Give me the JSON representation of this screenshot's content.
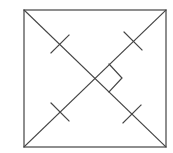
{
  "diagram": {
    "title": "",
    "stroke_color": "#444444",
    "background_color": "#ffffff",
    "square": {
      "x1": 24,
      "y1": 10,
      "x2": 166,
      "y2": 147
    },
    "center": {
      "x": 95,
      "y": 78
    },
    "diagonals": [
      {
        "name": "diagonal-tl-br",
        "from": [
          24,
          10
        ],
        "to": [
          166,
          147
        ]
      },
      {
        "name": "diagonal-bl-tr",
        "from": [
          24,
          147
        ],
        "to": [
          166,
          10
        ]
      }
    ],
    "tick_marks": [
      {
        "name": "tick-upper-left",
        "cx": 60,
        "cy": 44
      },
      {
        "name": "tick-upper-right",
        "cx": 133,
        "cy": 41
      },
      {
        "name": "tick-lower-left",
        "cx": 60,
        "cy": 112
      },
      {
        "name": "tick-lower-right",
        "cx": 132,
        "cy": 114
      }
    ],
    "right_angle_marker": {
      "points": [
        [
          109,
          64
        ],
        [
          122,
          78
        ],
        [
          109,
          92
        ]
      ]
    },
    "labels": []
  }
}
